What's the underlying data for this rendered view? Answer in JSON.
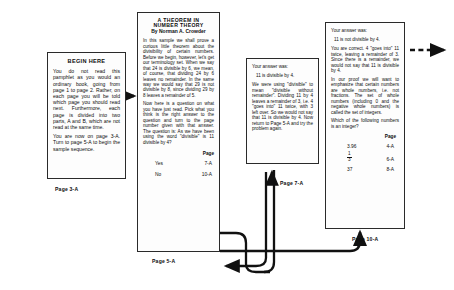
{
  "diagram": {
    "ink_color": "#111111",
    "paper_color": "#fdfdfd"
  },
  "panels": {
    "begin": {
      "heading": "BEGIN HERE",
      "paragraphs": [
        "You do not read this pamphlet as you would an ordinary book, going from page 1 to page 2. Rather, on each page you will be told which page you should read next. Furthermore, each page is divided into two parts, A and B, which are not read at the same time.",
        "You are now on page 3-A. Turn to page 5-A to begin the sample sequence."
      ],
      "caption": "Page 3-A"
    },
    "theorem": {
      "title_line1": "A THEOREM IN",
      "title_line2": "NUMBER THEORY",
      "byline": "By Norman A. Crowder",
      "paragraphs": [
        "In this sample we shall prove a curious little theorem about the divisibility of certain numbers. Before we begin, however, let's get our terminology set. When we say that 24 is divisible by 6, we mean, of course, that dividing 24 by 6 leaves no remainder. In the same way we would say that 29 is not divisible by 8, since dividing 29 by 8 leaves a remainder of 5.",
        "Now here is a question on what you have just read. Pick what you think is the right answer to the question and turn to the page number given with that answer. The question is: As we have been using the word \"divisible\" is 11 divisible by 4?"
      ],
      "answer_header": "Page",
      "answers": [
        {
          "option": "Yes",
          "page": "7-A"
        },
        {
          "option": "No",
          "page": "10-A"
        }
      ],
      "caption": "Page 5-A"
    },
    "yes_branch": {
      "lead": "Your answer was:",
      "statement": "11 is divisible by 4.",
      "body": "We were using \"divisible\" to mean \"divisible without remainder\". Dividing 11 by 4 leaves a remainder of 3, i.e. 4 \"goes into\" 11 twice, with 3 left over. So we would not say that 11 is divisible by 4. Now return to Page 5-A and try the problem again.",
      "caption": "Page 7-A"
    },
    "no_branch": {
      "lead": "Your answer was:",
      "statement": "11 is not divisible by 4.",
      "paragraphs": [
        "You are correct. 4 \"goes into\" 11 twice, leaving a remainder of 3. Since there is a remainder, we would not say that 11 is divisible by 4.",
        "In our proof we will want to emphasize that certain numbers are whole numbers, i.e. not fractions. The set of whole numbers (including 0 and the negative whole numbers) is called the set of integers.",
        "Which of the following numbers is an integer?"
      ],
      "table_header": "Page",
      "rows": [
        {
          "value": "3.96",
          "is_fraction": false,
          "page": "4-A"
        },
        {
          "value": "1/3",
          "is_fraction": true,
          "numerator": "1",
          "denominator": "3",
          "page": "6-A"
        },
        {
          "value": "37",
          "is_fraction": false,
          "page": "8-A"
        }
      ],
      "caption": "Page 10-A"
    }
  },
  "connectors": [
    {
      "name": "begin-to-theorem",
      "style": "solid-arrow"
    },
    {
      "name": "yes-answer-to-7a",
      "style": "solid-curved-arrow"
    },
    {
      "name": "7a-return-to-5a",
      "style": "solid-curved-arrow"
    },
    {
      "name": "no-answer-to-10a",
      "style": "solid-curved-arrow"
    },
    {
      "name": "10a-continues",
      "style": "dashed-arrow"
    }
  ]
}
